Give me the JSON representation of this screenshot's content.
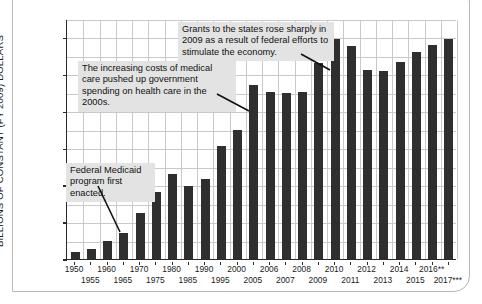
{
  "chart_data": {
    "type": "bar",
    "title": "",
    "xlabel": "",
    "ylabel": "BILLIONS OF CONSTANT (FY 2009) DOLLARS",
    "ylim": [
      0,
      650
    ],
    "yticks": [
      0,
      100,
      200,
      300,
      400,
      500,
      600
    ],
    "ytick_labels": [
      "0",
      "100",
      "200",
      "300",
      "400",
      "500",
      "600"
    ],
    "grid": true,
    "legend": "none",
    "bar_color": "#2f2f2f",
    "categories": [
      "1950",
      "1955",
      "1960",
      "1965",
      "1970",
      "1975",
      "1980",
      "1985",
      "1990",
      "1995",
      "2000",
      "2005",
      "2006",
      "2007",
      "2008",
      "2009",
      "2010",
      "2011",
      "2012",
      "2013",
      "2014",
      "2015",
      "2016**",
      "2017***"
    ],
    "values": [
      20,
      27,
      50,
      70,
      125,
      182,
      230,
      197,
      217,
      306,
      350,
      470,
      452,
      450,
      453,
      530,
      597,
      578,
      512,
      508,
      533,
      562,
      580,
      597
    ],
    "xtick_labels_top": [
      "1950",
      "1960",
      "1970",
      "1980",
      "1990",
      "2000",
      "2006",
      "2008",
      "2010",
      "2012",
      "2014",
      "2016**"
    ],
    "xtick_labels_bottom": [
      "1955",
      "1965",
      "1975",
      "1985",
      "1995",
      "2005",
      "2007",
      "2009",
      "2011",
      "2013",
      "2015",
      "2017***"
    ],
    "annotations": [
      {
        "id": "grants-2009",
        "text": "Grants to the states rose sharply in 2009 as a result of federal efforts to stimulate the economy.",
        "points_to": "2009"
      },
      {
        "id": "medical-costs",
        "text": "The increasing costs of medical care pushed up government spending on health care in the 2000s.",
        "points_to": "2005"
      },
      {
        "id": "medicaid-enacted",
        "text": "Federal Medicaid program first enacted.",
        "points_to": "1965"
      }
    ]
  },
  "axis": {
    "y_title": "BILLIONS OF CONSTANT (FY 2009) DOLLARS"
  },
  "annotations": {
    "grants_2009": "Grants to the states rose sharply in 2009 as a result of federal efforts to stimulate the economy.",
    "medical_costs": "The increasing costs of medical care pushed up government spending on health care in the 2000s.",
    "medicaid_enacted": "Federal Medicaid program first enacted."
  }
}
